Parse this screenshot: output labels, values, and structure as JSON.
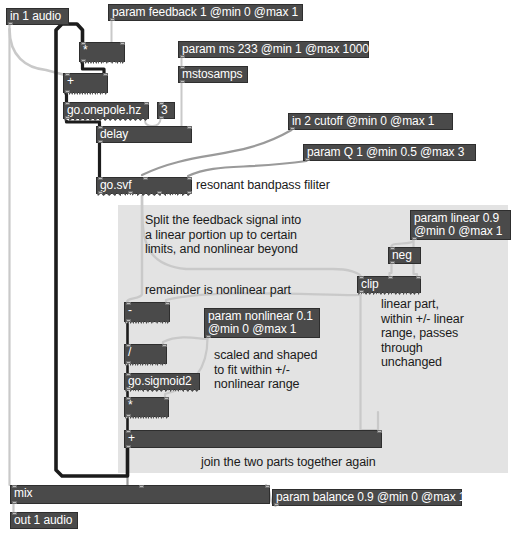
{
  "patch": {
    "title": "feedback delay with nonlinear saturation patch",
    "background": "#ffffff",
    "region_color": "#e3e3e3",
    "object_color": "#4a4a4a",
    "text_color": "#ffffff",
    "comment_color": "#1a1a1a"
  },
  "objects": [
    {
      "id": "in1",
      "label": "in 1 audio",
      "x": 6,
      "y": 8,
      "w": 63,
      "h": 17,
      "inlets": 0,
      "outlets": 1,
      "signal_out": false
    },
    {
      "id": "paramfb",
      "label": "param feedback 1 @min 0 @max 1",
      "x": 108,
      "y": 4,
      "w": 195,
      "h": 17,
      "inlets": 0,
      "outlets": 1,
      "signal_out": false
    },
    {
      "id": "mul1",
      "label": "*",
      "x": 79,
      "y": 42,
      "w": 46,
      "h": 20,
      "inlets": 2,
      "outlets": 1,
      "signal_out": true
    },
    {
      "id": "parammx",
      "label": "param ms 233 @min 1 @max 1000",
      "x": 178,
      "y": 41,
      "w": 191,
      "h": 17,
      "inlets": 0,
      "outlets": 1,
      "signal_out": false
    },
    {
      "id": "mstosamps",
      "label": "mstosamps",
      "x": 178,
      "y": 66,
      "w": 70,
      "h": 17,
      "inlets": 1,
      "outlets": 1,
      "signal_out": false
    },
    {
      "id": "add1",
      "label": "+",
      "x": 63,
      "y": 73,
      "w": 45,
      "h": 20,
      "inlets": 2,
      "outlets": 1,
      "signal_out": true
    },
    {
      "id": "onepole",
      "label": "go.onepole.hz",
      "x": 63,
      "y": 102,
      "w": 86,
      "h": 17,
      "inlets": 2,
      "outlets": 1,
      "signal_out": true
    },
    {
      "id": "three",
      "label": "3",
      "x": 157,
      "y": 102,
      "w": 18,
      "h": 17,
      "inlets": 1,
      "outlets": 1,
      "signal_out": false
    },
    {
      "id": "delay",
      "label": "delay",
      "x": 96,
      "y": 126,
      "w": 96,
      "h": 17,
      "inlets": 2,
      "outlets": 1,
      "signal_out": false
    },
    {
      "id": "in2",
      "label": "in 2 cutoff @min 0 @max 1",
      "x": 288,
      "y": 113,
      "w": 165,
      "h": 17,
      "inlets": 0,
      "outlets": 1,
      "signal_out": false
    },
    {
      "id": "paramq",
      "label": "param Q 1 @min 0.5 @max 3",
      "x": 303,
      "y": 144,
      "w": 173,
      "h": 17,
      "inlets": 0,
      "outlets": 1,
      "signal_out": false
    },
    {
      "id": "svf",
      "label": "go.svf",
      "x": 96,
      "y": 177,
      "w": 96,
      "h": 17,
      "inlets": 3,
      "outlets": 4,
      "signal_out": true
    },
    {
      "id": "paramlin",
      "label": "param linear 0.9\n@min 0 @max 1",
      "x": 410,
      "y": 210,
      "w": 101,
      "h": 30,
      "inlets": 0,
      "outlets": 1,
      "signal_out": false
    },
    {
      "id": "neg",
      "label": "neg",
      "x": 388,
      "y": 247,
      "w": 33,
      "h": 17,
      "inlets": 1,
      "outlets": 1,
      "signal_out": false
    },
    {
      "id": "clip",
      "label": "clip",
      "x": 357,
      "y": 276,
      "w": 64,
      "h": 17,
      "inlets": 3,
      "outlets": 1,
      "signal_out": true
    },
    {
      "id": "sub",
      "label": "-",
      "x": 124,
      "y": 302,
      "w": 46,
      "h": 20,
      "inlets": 2,
      "outlets": 1,
      "signal_out": true
    },
    {
      "id": "paramnl",
      "label": "param nonlinear 0.1\n@min 0 @max 1",
      "x": 204,
      "y": 308,
      "w": 116,
      "h": 30,
      "inlets": 0,
      "outlets": 1,
      "signal_out": false
    },
    {
      "id": "div",
      "label": "/",
      "x": 124,
      "y": 344,
      "w": 43,
      "h": 20,
      "inlets": 2,
      "outlets": 1,
      "signal_out": true
    },
    {
      "id": "sigmoid",
      "label": "go.sigmoid2",
      "x": 124,
      "y": 373,
      "w": 76,
      "h": 17,
      "inlets": 1,
      "outlets": 1,
      "signal_out": true
    },
    {
      "id": "mul2",
      "label": "*",
      "x": 124,
      "y": 397,
      "w": 45,
      "h": 20,
      "inlets": 2,
      "outlets": 1,
      "signal_out": true
    },
    {
      "id": "addwide",
      "label": "+",
      "x": 124,
      "y": 430,
      "w": 258,
      "h": 18,
      "inlets": 2,
      "outlets": 1,
      "signal_out": false
    },
    {
      "id": "mix",
      "label": "mix",
      "x": 10,
      "y": 485,
      "w": 260,
      "h": 19,
      "inlets": 3,
      "outlets": 1,
      "signal_out": false
    },
    {
      "id": "parambal",
      "label": "param balance 0.9 @min 0 @max 1",
      "x": 272,
      "y": 489,
      "w": 190,
      "h": 17,
      "inlets": 0,
      "outlets": 1,
      "signal_out": false
    },
    {
      "id": "out1",
      "label": "out 1 audio",
      "x": 10,
      "y": 512,
      "w": 68,
      "h": 17,
      "inlets": 1,
      "outlets": 0,
      "signal_out": false
    }
  ],
  "region": {
    "x": 118,
    "y": 205,
    "w": 390,
    "h": 268
  },
  "comments": [
    {
      "id": "c-split",
      "text": "Split the feedback signal into\na linear portion up to certain\nlimits, and nonlinear beyond",
      "x": 145,
      "y": 213
    },
    {
      "id": "c-bandpass",
      "text": "resonant bandpass filiter",
      "x": 196,
      "y": 178
    },
    {
      "id": "c-remainder",
      "text": "remainder is nonlinear part",
      "x": 145,
      "y": 283
    },
    {
      "id": "c-linear",
      "text": "linear part,\nwithin +/- linear\nrange, passes\nthrough\nunchanged",
      "x": 381,
      "y": 297
    },
    {
      "id": "c-scaled",
      "text": "scaled and shaped\nto fit within +/-\nnonlinear range",
      "x": 214,
      "y": 348
    },
    {
      "id": "c-join",
      "text": "join the two parts together again",
      "x": 201,
      "y": 455
    }
  ],
  "cords": [
    {
      "id": "cord-in1-mix",
      "from": "in1",
      "to": "mix",
      "kind": "signal-light"
    },
    {
      "id": "cord-in1-add1",
      "from": "in1",
      "to": "add1",
      "kind": "signal-light"
    },
    {
      "id": "cord-paramfb-mul1",
      "from": "paramfb",
      "to": "mul1",
      "kind": "control"
    },
    {
      "id": "cord-mul1-add1",
      "from": "mul1",
      "to": "add1",
      "kind": "signal"
    },
    {
      "id": "cord-add1-onepole",
      "from": "add1",
      "to": "onepole",
      "kind": "signal"
    },
    {
      "id": "cord-three-onepole",
      "from": "three",
      "to": "onepole",
      "kind": "control"
    },
    {
      "id": "cord-onepole-delay",
      "from": "onepole",
      "to": "delay",
      "kind": "signal"
    },
    {
      "id": "cord-parammx-msts",
      "from": "parammx",
      "to": "mstosamps",
      "kind": "control"
    },
    {
      "id": "cord-msts-delay",
      "from": "mstosamps",
      "to": "delay",
      "kind": "control"
    },
    {
      "id": "cord-delay-svf",
      "from": "delay",
      "to": "svf",
      "kind": "signal"
    },
    {
      "id": "cord-in2-svf",
      "from": "in2",
      "to": "svf",
      "kind": "control"
    },
    {
      "id": "cord-paramq-svf",
      "from": "paramq",
      "to": "svf",
      "kind": "control"
    },
    {
      "id": "cord-svf-clip",
      "from": "svf",
      "to": "clip",
      "kind": "signal-light"
    },
    {
      "id": "cord-svf-sub",
      "from": "svf",
      "to": "sub",
      "kind": "signal-light"
    },
    {
      "id": "cord-paramlin-neg",
      "from": "paramlin",
      "to": "neg",
      "kind": "control"
    },
    {
      "id": "cord-paramlin-clip",
      "from": "paramlin",
      "to": "clip",
      "kind": "control"
    },
    {
      "id": "cord-neg-clip",
      "from": "neg",
      "to": "clip",
      "kind": "control"
    },
    {
      "id": "cord-clip-sub",
      "from": "clip",
      "to": "sub",
      "kind": "signal-light"
    },
    {
      "id": "cord-clip-addwide",
      "from": "clip",
      "to": "addwide",
      "kind": "signal-light"
    },
    {
      "id": "cord-sub-div",
      "from": "sub",
      "to": "div",
      "kind": "signal"
    },
    {
      "id": "cord-paramnl-div",
      "from": "paramnl",
      "to": "div",
      "kind": "control"
    },
    {
      "id": "cord-paramnl-mul2",
      "from": "paramnl",
      "to": "mul2",
      "kind": "control"
    },
    {
      "id": "cord-div-sigmoid",
      "from": "div",
      "to": "sigmoid",
      "kind": "signal"
    },
    {
      "id": "cord-sigmoid-mul2",
      "from": "sigmoid",
      "to": "mul2",
      "kind": "signal"
    },
    {
      "id": "cord-mul2-addwide",
      "from": "mul2",
      "to": "addwide",
      "kind": "signal"
    },
    {
      "id": "cord-addwide-mix",
      "from": "addwide",
      "to": "mix",
      "kind": "signal"
    },
    {
      "id": "cord-addwide-mul1",
      "from": "addwide",
      "to": "mul1",
      "kind": "feedback"
    },
    {
      "id": "cord-parambal-mix",
      "from": "parambal",
      "to": "mix",
      "kind": "control"
    },
    {
      "id": "cord-mix-out1",
      "from": "mix",
      "to": "out1",
      "kind": "signal"
    }
  ]
}
